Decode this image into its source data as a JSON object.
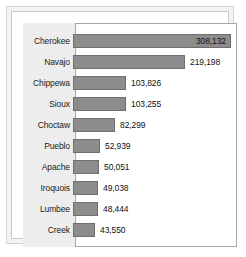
{
  "chart_data": {
    "type": "bar",
    "orientation": "horizontal",
    "title": "",
    "subtitle": "",
    "xlabel": "",
    "ylabel": "",
    "grid": false,
    "legend": null,
    "xlim": [
      0,
      308132
    ],
    "categories": [
      "Cherokee",
      "Navajo",
      "Chippewa",
      "Sioux",
      "Choctaw",
      "Pueblo",
      "Apache",
      "Iroquois",
      "Lumbee",
      "Creek"
    ],
    "values": [
      308132,
      219198,
      103826,
      103255,
      82299,
      52939,
      50051,
      49038,
      48444,
      43550
    ],
    "value_labels": [
      "308,132",
      "219,198",
      "103,826",
      "103,255",
      "82,299",
      "52,939",
      "50,051",
      "49,038",
      "48,444",
      "43,550"
    ],
    "label_inside_bar": [
      true,
      false,
      false,
      false,
      false,
      false,
      false,
      false,
      false,
      false
    ],
    "bars": [
      {
        "label": "Cherokee",
        "value": 308132,
        "value_label": "308,132",
        "label_inside": true
      },
      {
        "label": "Navajo",
        "value": 219198,
        "value_label": "219,198",
        "label_inside": false
      },
      {
        "label": "Chippewa",
        "value": 103826,
        "value_label": "103,826",
        "label_inside": false
      },
      {
        "label": "Sioux",
        "value": 103255,
        "value_label": "103,255",
        "label_inside": false
      },
      {
        "label": "Choctaw",
        "value": 82299,
        "value_label": "82,299",
        "label_inside": false
      },
      {
        "label": "Pueblo",
        "value": 52939,
        "value_label": "52,939",
        "label_inside": false
      },
      {
        "label": "Apache",
        "value": 50051,
        "value_label": "50,051",
        "label_inside": false
      },
      {
        "label": "Iroquois",
        "value": 49038,
        "value_label": "49,038",
        "label_inside": false
      },
      {
        "label": "Lumbee",
        "value": 48444,
        "value_label": "48,444",
        "label_inside": false
      },
      {
        "label": "Creek",
        "value": 43550,
        "value_label": "43,550",
        "label_inside": false
      }
    ],
    "colors": {
      "bar_fill": "#8c8c8c",
      "bar_stroke": "#6f6f6f",
      "label_panel": "#ededed",
      "plot_background": "#ffffff",
      "frame": "#c8c8c8",
      "text": "#111111"
    }
  }
}
